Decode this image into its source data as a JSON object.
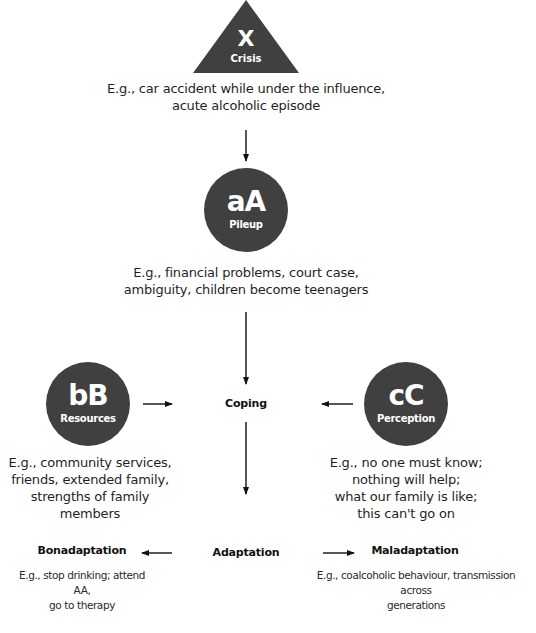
{
  "diagram": {
    "crisis": {
      "symbol": "X",
      "label": "Crisis",
      "description": [
        "E.g., car accident while under the influence,",
        "acute alcoholic episode"
      ]
    },
    "pileup": {
      "symbol": "aA",
      "label": "Pileup",
      "description": [
        "E.g., financial problems, court case,",
        "ambiguity, children become teenagers"
      ]
    },
    "resources": {
      "symbol": "bB",
      "label": "Resources",
      "description": [
        "E.g., community services,",
        "friends, extended family,",
        "strengths of family members"
      ]
    },
    "perception": {
      "symbol": "cC",
      "label": "Perception",
      "description": [
        "E.g., no one must know;",
        "nothing will help;",
        "what our family is like;",
        "this can't go on"
      ]
    },
    "coping": {
      "label": "Coping"
    },
    "adaptation": {
      "label": "Adaptation"
    },
    "bonadaptation": {
      "label": "Bonadaptation",
      "description": [
        "E.g., stop drinking; attend AA,",
        "go to therapy"
      ]
    },
    "maladaptation": {
      "label": "Maladaptation",
      "description": [
        "E.g., coalcoholic behaviour, transmission across",
        "generations"
      ]
    },
    "colors": {
      "node_fill": "#404040",
      "node_text": "#ffffff",
      "arrow": "#111111"
    }
  }
}
